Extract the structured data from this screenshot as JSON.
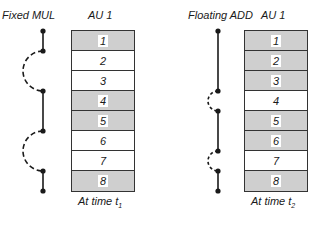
{
  "left_panel": {
    "operation_label": "Fixed MUL",
    "unit_label": "AU 1",
    "caption_prefix": "At time t",
    "caption_subscript": "1",
    "rows": [
      {
        "label": "1",
        "state": "busy"
      },
      {
        "label": "2",
        "state": "free"
      },
      {
        "label": "3",
        "state": "free"
      },
      {
        "label": "4",
        "state": "busy"
      },
      {
        "label": "5",
        "state": "busy"
      },
      {
        "label": "6",
        "state": "free"
      },
      {
        "label": "7",
        "state": "free"
      },
      {
        "label": "8",
        "state": "busy"
      }
    ],
    "chain": {
      "nodes_at_row_boundaries": [
        0,
        1,
        3,
        5,
        7,
        8
      ],
      "solid_segments": [
        [
          0,
          1
        ],
        [
          3,
          5
        ],
        [
          7,
          8
        ]
      ],
      "dashed_arcs": [
        [
          1,
          3
        ],
        [
          5,
          7
        ]
      ]
    }
  },
  "right_panel": {
    "operation_label": "Floating ADD",
    "unit_label": "AU 1",
    "caption_prefix": "At time t",
    "caption_subscript": "2",
    "rows": [
      {
        "label": "1",
        "state": "busy"
      },
      {
        "label": "2",
        "state": "busy"
      },
      {
        "label": "3",
        "state": "busy"
      },
      {
        "label": "4",
        "state": "free"
      },
      {
        "label": "5",
        "state": "busy"
      },
      {
        "label": "6",
        "state": "busy"
      },
      {
        "label": "7",
        "state": "free"
      },
      {
        "label": "8",
        "state": "busy"
      }
    ],
    "chain": {
      "nodes_at_row_boundaries": [
        0,
        3,
        4,
        6,
        7,
        8
      ],
      "solid_segments": [
        [
          0,
          3
        ],
        [
          4,
          6
        ],
        [
          7,
          8
        ]
      ],
      "dashed_arcs": [
        [
          3,
          4
        ],
        [
          6,
          7
        ]
      ]
    }
  },
  "colors": {
    "busy_fill": "#cfcfcf",
    "free_fill": "#ffffff",
    "line": "#1a1a1a"
  }
}
